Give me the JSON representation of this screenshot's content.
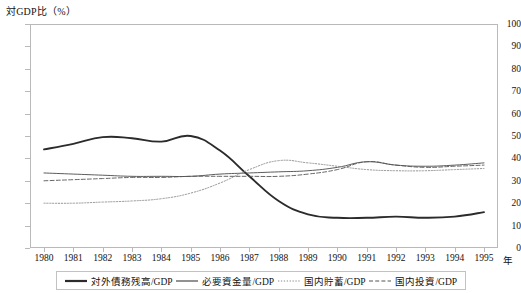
{
  "chart_data": {
    "type": "line",
    "title": "対GDP比（%）",
    "xlabel": "年",
    "ylabel": "対GDP比（%）",
    "ylim": [
      0,
      100
    ],
    "ytick_step": 10,
    "yticks": [
      0,
      10,
      20,
      30,
      40,
      50,
      60,
      70,
      80,
      90,
      100
    ],
    "grid": false,
    "legend_position": "bottom",
    "x": [
      1980,
      1981,
      1982,
      1983,
      1984,
      1985,
      1986,
      1987,
      1988,
      1989,
      1990,
      1991,
      1992,
      1993,
      1994,
      1995
    ],
    "categories": [
      "1980",
      "1981",
      "1982",
      "1983",
      "1984",
      "1985",
      "1986",
      "1987",
      "1988",
      "1989",
      "1990",
      "1991",
      "1992",
      "1993",
      "1994",
      "1995"
    ],
    "series": [
      {
        "name": "対外債務残高/GDP",
        "style": "solid-thick",
        "color": "#2b2b2b",
        "values": [
          44,
          46.5,
          49.5,
          49,
          47.5,
          50,
          43.5,
          32,
          21,
          15,
          13.5,
          13.5,
          14,
          13.5,
          14,
          16
        ]
      },
      {
        "name": "必要資金量/GDP",
        "style": "solid-thin",
        "color": "#4a4a4a",
        "values": [
          33.5,
          33,
          32.5,
          32,
          32,
          32,
          33,
          33.5,
          34,
          34.5,
          36,
          38.5,
          37,
          36.5,
          37,
          38
        ]
      },
      {
        "name": "国内貯蓄/GDP",
        "style": "dotted",
        "color": "#8a8a8a",
        "values": [
          20,
          20,
          20.5,
          21,
          22,
          24.5,
          29,
          35,
          39,
          38,
          36.5,
          35,
          34.5,
          34.5,
          35,
          35.5
        ]
      },
      {
        "name": "国内投資/GDP",
        "style": "dashed",
        "color": "#555555",
        "values": [
          30,
          30.5,
          31,
          31.5,
          31.5,
          32,
          32,
          32,
          32,
          33,
          35,
          38.5,
          37,
          36,
          36.5,
          37
        ]
      }
    ]
  },
  "legend": {
    "items": [
      {
        "label": "対外債務残高/GDP",
        "style": "solid-thick"
      },
      {
        "label": "必要資金量/GDP",
        "style": "solid-thin"
      },
      {
        "label": "国内貯蓄/GDP",
        "style": "dotted"
      },
      {
        "label": "国内投資/GDP",
        "style": "dashed"
      }
    ]
  },
  "axes": {
    "x_unit_label": "年"
  }
}
